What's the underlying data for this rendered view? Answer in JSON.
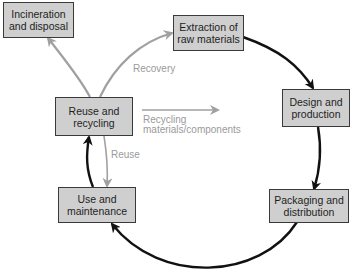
{
  "nodes": {
    "incineration": "Incineration\nand disposal",
    "extraction": "Extraction of\nraw materials",
    "design": "Design and\nproduction",
    "packaging": "Packaging and\ndistribution",
    "use": "Use and\nmaintenance",
    "reuse_recycling": "Reuse and\nrecycling"
  },
  "edge_labels": {
    "recovery": "Recovery",
    "recycling": "Recycling\n materials/components",
    "reuse": "Reuse"
  },
  "colors": {
    "box_fill": "#cfcfcf",
    "box_border": "#3a3a3a",
    "main_cycle_arrow": "#111111",
    "secondary_arrow": "#a0a0a0",
    "secondary_label": "#9a9a9a"
  }
}
